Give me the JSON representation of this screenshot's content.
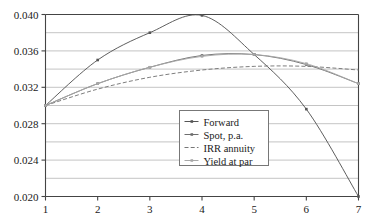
{
  "chart_data": {
    "type": "line",
    "title": "",
    "xlabel": "",
    "ylabel": "",
    "x": [
      1,
      2,
      3,
      4,
      5,
      6,
      7
    ],
    "xlim": [
      1,
      7
    ],
    "ylim": [
      0.02,
      0.04
    ],
    "xticks": [
      "1",
      "2",
      "3",
      "4",
      "5",
      "6",
      "7"
    ],
    "yticks": [
      "0.020",
      "0.024",
      "0.028",
      "0.032",
      "0.036",
      "0.040"
    ],
    "grid": "horizontal-major-and-minor",
    "legend_position": "center",
    "series": [
      {
        "name": "Forward",
        "marker": "dot",
        "style": "solid",
        "color": "#555555",
        "values": [
          0.03,
          0.035,
          0.038,
          0.0399,
          0.0356,
          0.0296,
          0.02
        ]
      },
      {
        "name": "Spot, p.a.",
        "marker": "dot",
        "style": "solid",
        "color": "#6e6e6e",
        "values": [
          0.03,
          0.0324,
          0.0342,
          0.0355,
          0.0356,
          0.0345,
          0.0324
        ]
      },
      {
        "name": "IRR annuity",
        "marker": "none",
        "style": "dashed",
        "color": "#777777",
        "values": [
          0.03,
          0.0318,
          0.0331,
          0.0339,
          0.0343,
          0.0343,
          0.0339
        ]
      },
      {
        "name": "Yield at par",
        "marker": "dot",
        "style": "solid",
        "color": "#a8a8a8",
        "values": [
          0.03,
          0.0324,
          0.0342,
          0.0354,
          0.0356,
          0.0346,
          0.0324
        ]
      }
    ]
  },
  "axes": {
    "y_tick_labels": [
      "0.040",
      "0.036",
      "0.032",
      "0.028",
      "0.024",
      "0.020"
    ],
    "x_tick_labels": [
      "1",
      "2",
      "3",
      "4",
      "5",
      "6",
      "7"
    ]
  },
  "legend": {
    "items": [
      {
        "label": "Forward"
      },
      {
        "label": "Spot, p.a."
      },
      {
        "label": "IRR annuity"
      },
      {
        "label": "Yield at par"
      }
    ]
  },
  "colors": {
    "frame": "#444444",
    "gridline": "#b5b5b5",
    "text": "#1a1a1a",
    "legend_border": "#777777",
    "background": "#ffffff"
  }
}
